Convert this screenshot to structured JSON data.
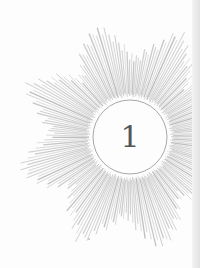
{
  "ornament": {
    "type": "starburst",
    "points": 8,
    "ray_color": "#b8b8b8",
    "circle_color": "#a8a8a8",
    "center": [
      130,
      137
    ],
    "circle_radius": 37,
    "number_label": "1"
  }
}
